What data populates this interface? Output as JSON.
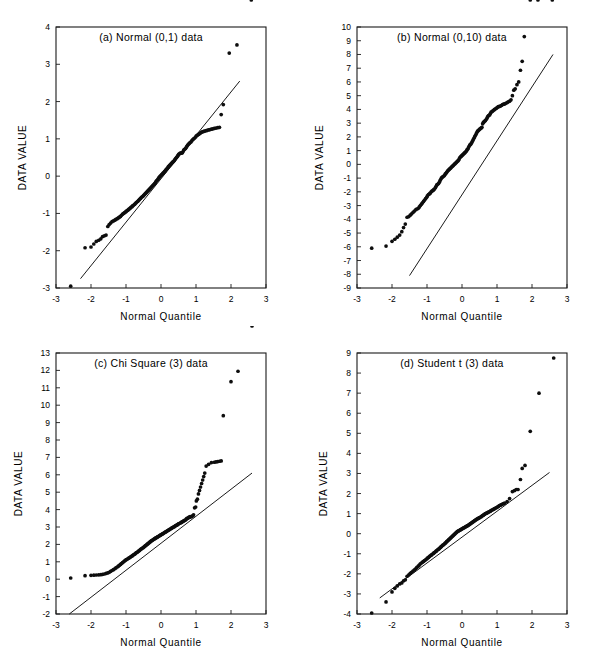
{
  "figure": {
    "background_color": "#ffffff",
    "ink_color": "#000000",
    "layout": "2x2 grid of Q-Q probability plots"
  },
  "chart_data": [
    {
      "type": "scatter",
      "panel": "a",
      "title": "(a) Normal (0,1) data",
      "xlabel": "Normal Quantile",
      "ylabel": "DATA VALUE",
      "xlim": [
        -3,
        3
      ],
      "ylim": [
        -3,
        4
      ],
      "xticks": [
        -3,
        -2,
        -1,
        0,
        1,
        2,
        3
      ],
      "yticks": [
        -3,
        -2,
        -1,
        0,
        1,
        2,
        3,
        4
      ],
      "grid": false,
      "legend": "none",
      "reference_line": {
        "x": [
          -2.3,
          2.25
        ],
        "y": [
          -2.75,
          2.55
        ]
      },
      "x": [
        -2.58,
        -2.17,
        -2.0,
        -1.92,
        -1.85,
        -1.78,
        -1.72,
        -1.67,
        -1.62,
        -1.57,
        -1.52,
        -1.48,
        -1.44,
        -1.4,
        -1.36,
        -1.32,
        -1.29,
        -1.25,
        -1.22,
        -1.19,
        -1.16,
        -1.13,
        -1.1,
        -1.07,
        -1.04,
        -1.01,
        -0.99,
        -0.96,
        -0.93,
        -0.91,
        -0.88,
        -0.86,
        -0.83,
        -0.81,
        -0.79,
        -0.76,
        -0.74,
        -0.72,
        -0.7,
        -0.67,
        -0.65,
        -0.63,
        -0.61,
        -0.59,
        -0.57,
        -0.55,
        -0.52,
        -0.5,
        -0.48,
        -0.46,
        -0.44,
        -0.42,
        -0.4,
        -0.38,
        -0.36,
        -0.34,
        -0.32,
        -0.3,
        -0.28,
        -0.26,
        -0.24,
        -0.22,
        -0.2,
        -0.18,
        -0.16,
        -0.14,
        -0.12,
        -0.1,
        -0.08,
        -0.06,
        -0.04,
        -0.02,
        0.0,
        0.02,
        0.04,
        0.06,
        0.08,
        0.1,
        0.12,
        0.14,
        0.16,
        0.18,
        0.2,
        0.22,
        0.24,
        0.26,
        0.28,
        0.3,
        0.32,
        0.34,
        0.36,
        0.38,
        0.4,
        0.42,
        0.44,
        0.46,
        0.48,
        0.5,
        0.52,
        0.55,
        0.57,
        0.59,
        0.61,
        0.63,
        0.65,
        0.67,
        0.7,
        0.72,
        0.74,
        0.76,
        0.79,
        0.81,
        0.83,
        0.86,
        0.88,
        0.91,
        0.93,
        0.96,
        0.99,
        1.01,
        1.04,
        1.07,
        1.1,
        1.13,
        1.16,
        1.19,
        1.22,
        1.25,
        1.29,
        1.32,
        1.36,
        1.4,
        1.44,
        1.48,
        1.52,
        1.57,
        1.62,
        1.67,
        1.72,
        1.78,
        1.95,
        2.17,
        2.58
      ],
      "y": [
        -2.95,
        -1.92,
        -1.9,
        -1.82,
        -1.75,
        -1.72,
        -1.68,
        -1.62,
        -1.6,
        -1.58,
        -1.35,
        -1.3,
        -1.26,
        -1.22,
        -1.2,
        -1.18,
        -1.16,
        -1.14,
        -1.12,
        -1.1,
        -1.08,
        -1.05,
        -1.02,
        -1.0,
        -0.98,
        -0.96,
        -0.94,
        -0.92,
        -0.9,
        -0.88,
        -0.86,
        -0.84,
        -0.82,
        -0.8,
        -0.78,
        -0.76,
        -0.74,
        -0.72,
        -0.7,
        -0.68,
        -0.66,
        -0.64,
        -0.62,
        -0.6,
        -0.58,
        -0.56,
        -0.54,
        -0.52,
        -0.5,
        -0.48,
        -0.46,
        -0.44,
        -0.42,
        -0.4,
        -0.38,
        -0.36,
        -0.34,
        -0.32,
        -0.3,
        -0.28,
        -0.26,
        -0.24,
        -0.22,
        -0.2,
        -0.17,
        -0.14,
        -0.12,
        -0.1,
        -0.07,
        -0.04,
        -0.02,
        0.0,
        0.02,
        0.04,
        0.06,
        0.08,
        0.1,
        0.12,
        0.14,
        0.17,
        0.19,
        0.21,
        0.24,
        0.26,
        0.28,
        0.3,
        0.32,
        0.34,
        0.36,
        0.38,
        0.4,
        0.42,
        0.45,
        0.47,
        0.5,
        0.52,
        0.55,
        0.58,
        0.6,
        0.62,
        0.62,
        0.62,
        0.63,
        0.66,
        0.7,
        0.72,
        0.74,
        0.77,
        0.8,
        0.83,
        0.86,
        0.88,
        0.9,
        0.92,
        0.95,
        0.98,
        1.0,
        1.02,
        1.05,
        1.08,
        1.1,
        1.12,
        1.14,
        1.16,
        1.18,
        1.19,
        1.2,
        1.21,
        1.22,
        1.23,
        1.24,
        1.25,
        1.26,
        1.27,
        1.28,
        1.29,
        1.3,
        1.31,
        1.65,
        1.92,
        3.3,
        3.52
      ]
    },
    {
      "type": "scatter",
      "panel": "b",
      "title": "(b) Normal (0,10) data",
      "xlabel": "Normal Quantile",
      "ylabel": "DATA VALUE",
      "xlim": [
        -3,
        3
      ],
      "ylim": [
        -9,
        10
      ],
      "xticks": [
        -3,
        -2,
        -1,
        0,
        1,
        2,
        3
      ],
      "yticks": [
        -9,
        -8,
        -7,
        -6,
        -5,
        -4,
        -3,
        -2,
        -1,
        0,
        1,
        2,
        3,
        4,
        5,
        6,
        7,
        8,
        9,
        10
      ],
      "grid": false,
      "legend": "none",
      "reference_line": {
        "x": [
          -1.5,
          2.6
        ],
        "y": [
          -8.1,
          8.0
        ]
      },
      "x": [
        -2.58,
        -2.17,
        -2.0,
        -1.92,
        -1.85,
        -1.78,
        -1.72,
        -1.67,
        -1.62,
        -1.57,
        -1.52,
        -1.48,
        -1.44,
        -1.4,
        -1.36,
        -1.32,
        -1.29,
        -1.25,
        -1.22,
        -1.19,
        -1.16,
        -1.13,
        -1.1,
        -1.07,
        -1.04,
        -1.01,
        -0.99,
        -0.96,
        -0.93,
        -0.91,
        -0.88,
        -0.86,
        -0.83,
        -0.81,
        -0.79,
        -0.76,
        -0.74,
        -0.72,
        -0.7,
        -0.67,
        -0.65,
        -0.63,
        -0.61,
        -0.59,
        -0.57,
        -0.55,
        -0.52,
        -0.5,
        -0.48,
        -0.46,
        -0.44,
        -0.42,
        -0.4,
        -0.38,
        -0.36,
        -0.34,
        -0.32,
        -0.3,
        -0.28,
        -0.26,
        -0.24,
        -0.22,
        -0.2,
        -0.18,
        -0.16,
        -0.14,
        -0.12,
        -0.1,
        -0.08,
        -0.06,
        -0.04,
        -0.02,
        0.0,
        0.02,
        0.04,
        0.06,
        0.08,
        0.1,
        0.12,
        0.14,
        0.16,
        0.18,
        0.2,
        0.22,
        0.24,
        0.26,
        0.28,
        0.3,
        0.32,
        0.34,
        0.36,
        0.38,
        0.4,
        0.42,
        0.44,
        0.46,
        0.48,
        0.5,
        0.52,
        0.55,
        0.57,
        0.59,
        0.61,
        0.63,
        0.65,
        0.67,
        0.7,
        0.72,
        0.74,
        0.76,
        0.79,
        0.81,
        0.83,
        0.86,
        0.88,
        0.91,
        0.93,
        0.96,
        0.99,
        1.01,
        1.04,
        1.07,
        1.1,
        1.13,
        1.16,
        1.19,
        1.22,
        1.25,
        1.29,
        1.32,
        1.36,
        1.4,
        1.44,
        1.48,
        1.52,
        1.57,
        1.62,
        1.67,
        1.72,
        1.78,
        1.95,
        2.17,
        2.58
      ],
      "y": [
        -6.1,
        -5.95,
        -5.6,
        -5.45,
        -5.3,
        -5.15,
        -4.9,
        -4.6,
        -4.35,
        -3.85,
        -3.8,
        -3.7,
        -3.6,
        -3.5,
        -3.4,
        -3.3,
        -3.25,
        -3.2,
        -3.1,
        -3.0,
        -2.9,
        -2.8,
        -2.7,
        -2.6,
        -2.5,
        -2.4,
        -2.3,
        -2.2,
        -2.15,
        -2.1,
        -2.0,
        -1.95,
        -1.9,
        -1.85,
        -1.8,
        -1.7,
        -1.6,
        -1.5,
        -1.45,
        -1.4,
        -1.3,
        -1.2,
        -1.1,
        -1.0,
        -0.95,
        -0.9,
        -0.85,
        -0.8,
        -0.7,
        -0.65,
        -0.6,
        -0.5,
        -0.45,
        -0.4,
        -0.35,
        -0.3,
        -0.25,
        -0.2,
        -0.15,
        -0.1,
        -0.05,
        0.0,
        0.05,
        0.1,
        0.15,
        0.2,
        0.25,
        0.3,
        0.4,
        0.5,
        0.55,
        0.6,
        0.65,
        0.7,
        0.75,
        0.8,
        0.85,
        0.9,
        0.95,
        1.05,
        1.1,
        1.2,
        1.3,
        1.4,
        1.45,
        1.5,
        1.6,
        1.7,
        1.8,
        1.9,
        2.0,
        2.1,
        2.2,
        2.3,
        2.4,
        2.45,
        2.5,
        2.55,
        2.6,
        2.65,
        2.7,
        2.95,
        3.05,
        3.1,
        3.15,
        3.2,
        3.3,
        3.4,
        3.5,
        3.55,
        3.6,
        3.7,
        3.8,
        3.85,
        3.9,
        3.95,
        4.0,
        4.05,
        4.1,
        4.15,
        4.2,
        4.22,
        4.25,
        4.3,
        4.35,
        4.38,
        4.4,
        4.45,
        4.5,
        4.55,
        4.6,
        4.7,
        5.0,
        5.4,
        5.5,
        5.8,
        6.0,
        6.85,
        7.5,
        9.3
      ]
    },
    {
      "type": "scatter",
      "panel": "c",
      "title": "(c) Chi Square (3) data",
      "xlabel": "Normal Quantile",
      "ylabel": "DATA VALUE",
      "xlim": [
        -3,
        3
      ],
      "ylim": [
        -2,
        13
      ],
      "xticks": [
        -3,
        -2,
        -1,
        0,
        1,
        2,
        3
      ],
      "yticks": [
        -2,
        -1,
        0,
        1,
        2,
        3,
        4,
        5,
        6,
        7,
        8,
        9,
        10,
        11,
        12,
        13
      ],
      "grid": false,
      "legend": "none",
      "reference_line": {
        "x": [
          -2.62,
          2.6
        ],
        "y": [
          -2.0,
          6.1
        ]
      },
      "x": [
        -2.58,
        -2.17,
        -2.0,
        -1.92,
        -1.85,
        -1.78,
        -1.72,
        -1.67,
        -1.62,
        -1.57,
        -1.52,
        -1.48,
        -1.44,
        -1.4,
        -1.36,
        -1.32,
        -1.29,
        -1.25,
        -1.22,
        -1.19,
        -1.16,
        -1.13,
        -1.1,
        -1.07,
        -1.04,
        -1.01,
        -0.99,
        -0.96,
        -0.93,
        -0.91,
        -0.88,
        -0.86,
        -0.83,
        -0.81,
        -0.79,
        -0.76,
        -0.74,
        -0.72,
        -0.7,
        -0.67,
        -0.65,
        -0.63,
        -0.61,
        -0.59,
        -0.57,
        -0.55,
        -0.52,
        -0.5,
        -0.48,
        -0.46,
        -0.44,
        -0.42,
        -0.4,
        -0.38,
        -0.36,
        -0.34,
        -0.32,
        -0.3,
        -0.28,
        -0.26,
        -0.24,
        -0.22,
        -0.2,
        -0.18,
        -0.16,
        -0.14,
        -0.12,
        -0.1,
        -0.08,
        -0.06,
        -0.04,
        -0.02,
        0.0,
        0.02,
        0.04,
        0.06,
        0.08,
        0.1,
        0.12,
        0.14,
        0.16,
        0.18,
        0.2,
        0.22,
        0.24,
        0.26,
        0.28,
        0.3,
        0.32,
        0.34,
        0.36,
        0.38,
        0.4,
        0.42,
        0.44,
        0.46,
        0.48,
        0.5,
        0.52,
        0.55,
        0.57,
        0.59,
        0.61,
        0.63,
        0.65,
        0.67,
        0.7,
        0.72,
        0.74,
        0.76,
        0.79,
        0.81,
        0.83,
        0.86,
        0.88,
        0.91,
        0.93,
        0.96,
        0.99,
        1.01,
        1.04,
        1.07,
        1.1,
        1.13,
        1.16,
        1.19,
        1.22,
        1.25,
        1.29,
        1.36,
        1.44,
        1.52,
        1.57,
        1.62,
        1.67,
        1.72,
        1.78,
        2.0,
        2.2,
        2.6
      ],
      "y": [
        0.07,
        0.2,
        0.22,
        0.23,
        0.24,
        0.25,
        0.26,
        0.28,
        0.3,
        0.33,
        0.36,
        0.4,
        0.45,
        0.5,
        0.55,
        0.6,
        0.65,
        0.7,
        0.75,
        0.8,
        0.85,
        0.9,
        0.95,
        1.0,
        1.05,
        1.1,
        1.13,
        1.16,
        1.2,
        1.23,
        1.26,
        1.3,
        1.33,
        1.36,
        1.4,
        1.43,
        1.46,
        1.5,
        1.53,
        1.56,
        1.6,
        1.63,
        1.66,
        1.7,
        1.73,
        1.76,
        1.8,
        1.83,
        1.86,
        1.9,
        1.93,
        1.96,
        2.0,
        2.03,
        2.06,
        2.1,
        2.13,
        2.16,
        2.2,
        2.22,
        2.25,
        2.28,
        2.3,
        2.33,
        2.36,
        2.38,
        2.4,
        2.43,
        2.45,
        2.48,
        2.5,
        2.53,
        2.55,
        2.58,
        2.6,
        2.62,
        2.65,
        2.68,
        2.7,
        2.72,
        2.75,
        2.78,
        2.8,
        2.83,
        2.85,
        2.88,
        2.9,
        2.93,
        2.95,
        2.98,
        3.0,
        3.02,
        3.05,
        3.08,
        3.1,
        3.12,
        3.15,
        3.18,
        3.2,
        3.23,
        3.25,
        3.28,
        3.3,
        3.33,
        3.35,
        3.38,
        3.4,
        3.45,
        3.5,
        3.5,
        3.55,
        3.55,
        3.6,
        3.6,
        3.6,
        3.65,
        3.7,
        4.1,
        4.15,
        4.5,
        4.6,
        4.9,
        5.1,
        5.3,
        5.5,
        5.7,
        5.9,
        6.1,
        6.5,
        6.6,
        6.7,
        6.72,
        6.74,
        6.76,
        6.78,
        6.8,
        9.4,
        11.35,
        11.95
      ]
    },
    {
      "type": "scatter",
      "panel": "d",
      "title": "(d) Student t (3) data",
      "xlabel": "Normal Quantile",
      "ylabel": "DATA VALUE",
      "xlim": [
        -3,
        3
      ],
      "ylim": [
        -4,
        9
      ],
      "xticks": [
        -3,
        -2,
        -1,
        0,
        1,
        2,
        3
      ],
      "yticks": [
        -4,
        -3,
        -2,
        -1,
        0,
        1,
        2,
        3,
        4,
        5,
        6,
        7,
        8,
        9
      ],
      "grid": false,
      "legend": "none",
      "reference_line": {
        "x": [
          -2.35,
          2.5
        ],
        "y": [
          -3.2,
          3.05
        ]
      },
      "x": [
        -2.58,
        -2.17,
        -2.0,
        -1.92,
        -1.85,
        -1.78,
        -1.72,
        -1.67,
        -1.62,
        -1.57,
        -1.52,
        -1.48,
        -1.44,
        -1.4,
        -1.36,
        -1.32,
        -1.29,
        -1.25,
        -1.22,
        -1.19,
        -1.16,
        -1.13,
        -1.1,
        -1.07,
        -1.04,
        -1.01,
        -0.99,
        -0.96,
        -0.93,
        -0.91,
        -0.88,
        -0.86,
        -0.83,
        -0.81,
        -0.79,
        -0.76,
        -0.74,
        -0.72,
        -0.7,
        -0.67,
        -0.65,
        -0.63,
        -0.61,
        -0.59,
        -0.57,
        -0.55,
        -0.52,
        -0.5,
        -0.48,
        -0.46,
        -0.44,
        -0.42,
        -0.4,
        -0.38,
        -0.36,
        -0.34,
        -0.32,
        -0.3,
        -0.28,
        -0.26,
        -0.24,
        -0.22,
        -0.2,
        -0.18,
        -0.16,
        -0.14,
        -0.12,
        -0.1,
        -0.08,
        -0.06,
        -0.04,
        -0.02,
        0.0,
        0.02,
        0.04,
        0.06,
        0.08,
        0.1,
        0.12,
        0.14,
        0.16,
        0.18,
        0.2,
        0.22,
        0.24,
        0.26,
        0.28,
        0.3,
        0.32,
        0.34,
        0.36,
        0.38,
        0.4,
        0.42,
        0.44,
        0.46,
        0.48,
        0.5,
        0.52,
        0.55,
        0.57,
        0.59,
        0.61,
        0.63,
        0.65,
        0.67,
        0.7,
        0.72,
        0.74,
        0.76,
        0.79,
        0.81,
        0.83,
        0.86,
        0.88,
        0.91,
        0.93,
        0.96,
        0.99,
        1.01,
        1.04,
        1.07,
        1.1,
        1.13,
        1.16,
        1.19,
        1.22,
        1.29,
        1.36,
        1.44,
        1.5,
        1.55,
        1.6,
        1.67,
        1.72,
        1.8,
        1.95,
        2.2,
        2.62
      ],
      "y": [
        -3.95,
        -3.4,
        -2.9,
        -2.72,
        -2.6,
        -2.5,
        -2.45,
        -2.35,
        -2.3,
        -2.12,
        -2.05,
        -1.98,
        -1.92,
        -1.86,
        -1.8,
        -1.74,
        -1.68,
        -1.62,
        -1.56,
        -1.5,
        -1.46,
        -1.42,
        -1.38,
        -1.34,
        -1.3,
        -1.26,
        -1.22,
        -1.18,
        -1.14,
        -1.1,
        -1.07,
        -1.04,
        -1.0,
        -0.97,
        -0.94,
        -0.9,
        -0.87,
        -0.84,
        -0.8,
        -0.77,
        -0.74,
        -0.7,
        -0.67,
        -0.64,
        -0.6,
        -0.57,
        -0.54,
        -0.5,
        -0.47,
        -0.44,
        -0.4,
        -0.37,
        -0.34,
        -0.3,
        -0.27,
        -0.24,
        -0.2,
        -0.17,
        -0.14,
        -0.1,
        -0.07,
        -0.04,
        0.0,
        0.03,
        0.06,
        0.1,
        0.12,
        0.14,
        0.16,
        0.18,
        0.2,
        0.22,
        0.24,
        0.26,
        0.28,
        0.3,
        0.32,
        0.34,
        0.36,
        0.38,
        0.4,
        0.42,
        0.45,
        0.47,
        0.5,
        0.52,
        0.55,
        0.57,
        0.6,
        0.62,
        0.65,
        0.67,
        0.7,
        0.72,
        0.74,
        0.76,
        0.78,
        0.8,
        0.82,
        0.85,
        0.88,
        0.9,
        0.92,
        0.95,
        0.97,
        1.0,
        1.02,
        1.04,
        1.06,
        1.08,
        1.1,
        1.12,
        1.15,
        1.18,
        1.2,
        1.22,
        1.25,
        1.28,
        1.3,
        1.33,
        1.36,
        1.4,
        1.42,
        1.45,
        1.48,
        1.5,
        1.52,
        1.6,
        1.75,
        2.1,
        2.15,
        2.2,
        2.2,
        2.7,
        3.25,
        3.4,
        5.1,
        7.0,
        8.75
      ]
    }
  ]
}
